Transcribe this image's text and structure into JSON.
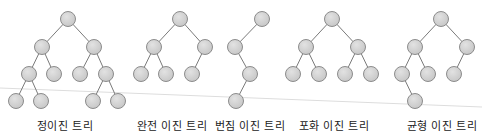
{
  "colors": {
    "background": "#ffffff",
    "node_fill": "#d3d3d3",
    "node_stroke": "#8c8c8c",
    "edge": "#7a7a7a",
    "artifact_line": "#dddddd",
    "label": "#222222"
  },
  "node_radius": 7.5,
  "artifact_line": {
    "x1": 0,
    "y1": 88,
    "x2": 482,
    "y2": 107
  },
  "trees": [
    {
      "id": "full",
      "label": "정이진 트리",
      "label_x": 65,
      "nodes": [
        [
          68,
          19
        ],
        [
          42,
          47
        ],
        [
          94,
          47
        ],
        [
          29,
          74
        ],
        [
          54,
          74
        ],
        [
          80,
          74
        ],
        [
          106,
          74
        ],
        [
          16,
          101
        ],
        [
          41,
          101
        ],
        [
          93,
          101
        ],
        [
          118,
          101
        ]
      ],
      "edges": [
        [
          0,
          1
        ],
        [
          0,
          2
        ],
        [
          1,
          3
        ],
        [
          1,
          4
        ],
        [
          2,
          5
        ],
        [
          2,
          6
        ],
        [
          3,
          7
        ],
        [
          3,
          8
        ],
        [
          6,
          9
        ],
        [
          6,
          10
        ]
      ]
    },
    {
      "id": "complete",
      "label": "완전 이진 트리",
      "label_x": 172,
      "nodes": [
        [
          180,
          19
        ],
        [
          154,
          47
        ],
        [
          205,
          47
        ],
        [
          141,
          74
        ],
        [
          166,
          74
        ],
        [
          192,
          74
        ]
      ],
      "edges": [
        [
          0,
          1
        ],
        [
          0,
          2
        ],
        [
          1,
          3
        ],
        [
          1,
          4
        ],
        [
          2,
          5
        ]
      ]
    },
    {
      "id": "skewed",
      "label": "번짐 이진 트리",
      "label_x": 250,
      "nodes": [
        [
          262,
          19
        ],
        [
          235,
          47
        ],
        [
          250,
          74
        ],
        [
          236,
          101
        ]
      ],
      "edges": [
        [
          0,
          1
        ],
        [
          1,
          2
        ],
        [
          2,
          3
        ]
      ]
    },
    {
      "id": "perfect",
      "label": "포화 이진 트리",
      "label_x": 334,
      "nodes": [
        [
          332,
          19
        ],
        [
          306,
          47
        ],
        [
          358,
          47
        ],
        [
          293,
          74
        ],
        [
          319,
          74
        ],
        [
          345,
          74
        ],
        [
          371,
          74
        ]
      ],
      "edges": [
        [
          0,
          1
        ],
        [
          0,
          2
        ],
        [
          1,
          3
        ],
        [
          1,
          4
        ],
        [
          2,
          5
        ],
        [
          2,
          6
        ]
      ]
    },
    {
      "id": "balanced",
      "label": "균형 이진 트리",
      "label_x": 442,
      "nodes": [
        [
          441,
          19
        ],
        [
          415,
          47
        ],
        [
          467,
          47
        ],
        [
          402,
          74
        ],
        [
          428,
          74
        ],
        [
          454,
          74
        ],
        [
          415,
          101
        ]
      ],
      "edges": [
        [
          0,
          1
        ],
        [
          0,
          2
        ],
        [
          1,
          3
        ],
        [
          1,
          4
        ],
        [
          2,
          5
        ],
        [
          3,
          6
        ]
      ]
    }
  ]
}
